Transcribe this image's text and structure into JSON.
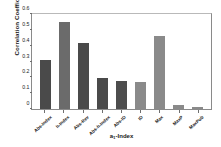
{
  "chart_data": {
    "type": "bar",
    "title": "",
    "xlabel": "a1-Index",
    "xlabel_base": "a",
    "xlabel_sub": "1",
    "xlabel_tail": "-Index",
    "ylabel": "Correlation Coefficient",
    "categories": [
      "Abs-Index",
      "h-Index",
      "Abs-Rev",
      "Abs-h-Index",
      "Abs-ID",
      "ID",
      "Max",
      "MaxP",
      "MaxPub"
    ],
    "values": [
      0.31,
      0.55,
      0.42,
      0.195,
      0.175,
      0.17,
      0.46,
      0.025,
      0.015
    ],
    "bar_colors": [
      "#4a4a4a",
      "#6b6b6b",
      "#4a4a4a",
      "#4a4a4a",
      "#4d4d4d",
      "#8a8a8a",
      "#8a8a8a",
      "#8a8a8a",
      "#8a8a8a"
    ],
    "yticks": [
      0,
      0.1,
      0.2,
      0.3,
      0.4,
      0.5,
      0.6
    ],
    "ytick_labels": [
      "0",
      "0.1",
      "0.2",
      "0.3",
      "0.4",
      "0.5",
      "0.6"
    ],
    "ylim": [
      0,
      0.6
    ],
    "grid": false,
    "legend": null,
    "frame_color": "#8a8a8a",
    "background": "#ffffff"
  }
}
